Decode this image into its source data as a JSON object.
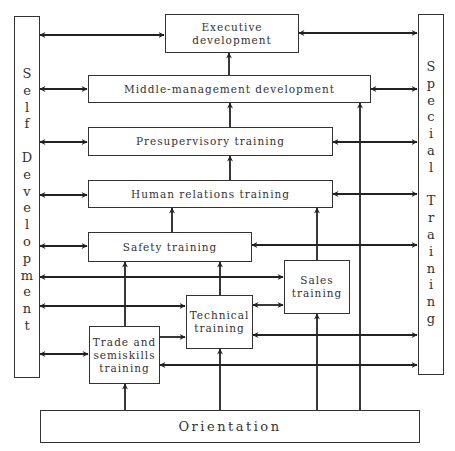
{
  "diagram": {
    "title": "",
    "colors": {
      "line": "#222222",
      "box_border": "#333333",
      "background": "#ffffff"
    },
    "side_panels": {
      "left": {
        "label": "Self Development",
        "letters": "S\ne\nl\nf\n\nD\ne\nv\ne\nl\no\np\nm\ne\nn\nt"
      },
      "right": {
        "label": "Special Training",
        "letters": "S\np\ne\nc\ni\na\nl\n\nT\nr\na\ni\nn\ni\nn\ng"
      }
    },
    "nodes": {
      "executive": "Executive development",
      "executive_line1": "Executive",
      "executive_line2": "development",
      "middle": "Middle-management development",
      "presupervisory": "Presupervisory training",
      "human_relations": "Human relations training",
      "safety": "Safety training",
      "sales": "Sales training",
      "sales_line1": "Sales",
      "sales_line2": "training",
      "technical": "Technical training",
      "technical_line1": "Technical",
      "technical_line2": "training",
      "trade": "Trade and semiskills training",
      "trade_line1": "Trade and",
      "trade_line2": "semiskills",
      "trade_line3": "training",
      "orientation": "Orientation"
    },
    "edges": [
      {
        "from": "self_development",
        "to": "executive",
        "type": "bidirectional"
      },
      {
        "from": "executive",
        "to": "special_training",
        "type": "bidirectional"
      },
      {
        "from": "self_development",
        "to": "middle",
        "type": "bidirectional"
      },
      {
        "from": "middle",
        "to": "special_training",
        "type": "bidirectional"
      },
      {
        "from": "self_development",
        "to": "presupervisory",
        "type": "bidirectional"
      },
      {
        "from": "presupervisory",
        "to": "special_training",
        "type": "bidirectional"
      },
      {
        "from": "self_development",
        "to": "human_relations",
        "type": "bidirectional"
      },
      {
        "from": "human_relations",
        "to": "special_training",
        "type": "bidirectional"
      },
      {
        "from": "self_development",
        "to": "safety",
        "type": "bidirectional"
      },
      {
        "from": "safety",
        "to": "special_training",
        "type": "bidirectional"
      },
      {
        "from": "self_development",
        "to": "sales",
        "type": "bidirectional"
      },
      {
        "from": "self_development",
        "to": "technical",
        "type": "bidirectional"
      },
      {
        "from": "technical",
        "to": "sales",
        "type": "bidirectional"
      },
      {
        "from": "technical",
        "to": "special_training",
        "type": "bidirectional"
      },
      {
        "from": "self_development",
        "to": "trade",
        "type": "bidirectional"
      },
      {
        "from": "trade",
        "to": "special_training",
        "type": "bidirectional"
      },
      {
        "from": "trade",
        "to": "technical",
        "type": "directed"
      },
      {
        "from": "trade",
        "to": "safety",
        "type": "directed"
      },
      {
        "from": "technical",
        "to": "safety",
        "type": "directed"
      },
      {
        "from": "safety",
        "to": "human_relations",
        "type": "directed"
      },
      {
        "from": "sales",
        "to": "human_relations",
        "type": "directed"
      },
      {
        "from": "human_relations",
        "to": "presupervisory",
        "type": "directed"
      },
      {
        "from": "presupervisory",
        "to": "middle",
        "type": "directed"
      },
      {
        "from": "middle",
        "to": "executive",
        "type": "directed"
      },
      {
        "from": "orientation",
        "to": "trade",
        "type": "directed"
      },
      {
        "from": "orientation",
        "to": "technical",
        "type": "directed"
      },
      {
        "from": "orientation",
        "to": "sales",
        "type": "directed"
      },
      {
        "from": "orientation",
        "to": "middle",
        "type": "directed"
      }
    ]
  }
}
